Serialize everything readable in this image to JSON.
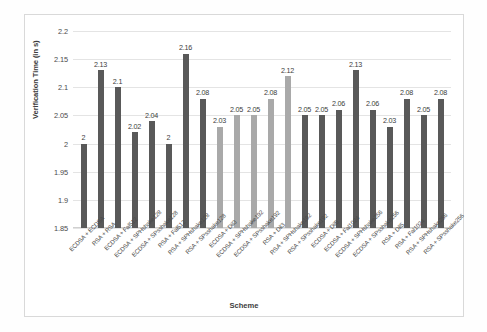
{
  "chart_data": {
    "type": "bar",
    "title": "",
    "xlabel": "Scheme",
    "ylabel": "Verification Time (in s)",
    "ylim": [
      1.85,
      2.2
    ],
    "yticks": [
      "1.85",
      "1.9",
      "1.95",
      "2",
      "2.05",
      "2.1",
      "2.15",
      "2.2"
    ],
    "grid": true,
    "legend": "none",
    "colors": {
      "dark": "#595959",
      "light": "#a9a9a9"
    },
    "categories": [
      "ECDSA + ECDSA",
      "RSA + RSA",
      "ECDSA + Fal512",
      "ECDSA + SPHshake128",
      "ECDSA + SPsshake128",
      "RSA + Fal512",
      "RSA + SPHshake128",
      "RSA + SPsshake128",
      "ECDSA + Dil3",
      "ECDSA + SPHshake192",
      "ECDSA + SPsshake192",
      "RSA + Dil3",
      "RSA + SPHshake192",
      "RSA + SPsshake192",
      "ECDSA + Dil5",
      "ECDSA + Fal1024",
      "ECDSA + SPHshake256",
      "ECDSA + SPsshake256",
      "RSA + Dil5",
      "RSA + Fal1024",
      "RSA + SPHshake256",
      "RSA + SPsshake256"
    ],
    "values": [
      2,
      2.13,
      2.1,
      2.02,
      2.04,
      2,
      2.16,
      2.08,
      2.03,
      2.05,
      2.05,
      2.08,
      2.12,
      2.05,
      2.05,
      2.06,
      2.13,
      2.06,
      2.03,
      2.08,
      2.05,
      2.08
    ],
    "value_labels": [
      "2",
      "2.13",
      "2.1",
      "2.02",
      "2.04",
      "2",
      "2.16",
      "2.08",
      "2.03",
      "2.05",
      "2.05",
      "2.08",
      "2.12",
      "2.05",
      "2.05",
      "2.06",
      "2.13",
      "2.06",
      "2.03",
      "2.08",
      "2.05",
      "2.08"
    ],
    "bar_shades": [
      "dark",
      "dark",
      "dark",
      "dark",
      "dark",
      "dark",
      "dark",
      "dark",
      "light",
      "light",
      "light",
      "light",
      "light",
      "dark",
      "dark",
      "dark",
      "dark",
      "dark",
      "dark",
      "dark",
      "dark",
      "dark"
    ]
  }
}
